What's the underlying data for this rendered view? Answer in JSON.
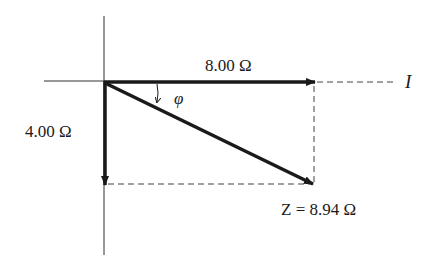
{
  "diagram": {
    "type": "impedance-phasor-diagram",
    "labels": {
      "resistance": "8.00 Ω",
      "reactance": "4.00 Ω",
      "current_axis": "I",
      "angle": "φ",
      "impedance": "Z = 8.94 Ω"
    },
    "vectors": [
      {
        "name": "resistance",
        "from": [
          0,
          0
        ],
        "to": [
          8.0,
          0
        ],
        "magnitude_ohm": 8.0,
        "direction": "along I axis (right)"
      },
      {
        "name": "reactance",
        "from": [
          0,
          0
        ],
        "to": [
          0,
          -4.0
        ],
        "magnitude_ohm": 4.0,
        "direction": "down"
      },
      {
        "name": "impedance",
        "from": [
          0,
          0
        ],
        "to": [
          8.0,
          -4.0
        ],
        "magnitude_ohm": 8.94,
        "direction": "diagonal down-right"
      }
    ],
    "colors": {
      "stroke": "#1a1a1a",
      "background": "#ffffff"
    }
  }
}
